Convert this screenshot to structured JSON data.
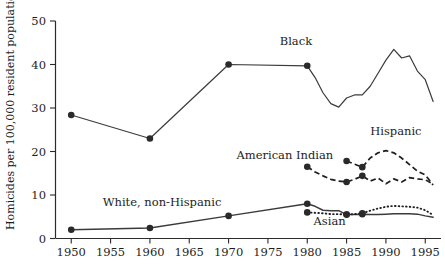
{
  "chart_data": {
    "type": "line",
    "title": "",
    "xlabel": "",
    "ylabel": "Homicides per 100,000 resident population",
    "xlim": [
      1948,
      1997
    ],
    "ylim": [
      0,
      50
    ],
    "xticks": [
      1950,
      1955,
      1960,
      1965,
      1970,
      1975,
      1980,
      1985,
      1990,
      1995
    ],
    "yticks": [
      0,
      10,
      20,
      30,
      40,
      50
    ],
    "grid": false,
    "legend": "inline-annotations",
    "series": [
      {
        "name": "Black",
        "label": "Black",
        "style": "solid",
        "markers": [
          1950,
          1960,
          1970,
          1980
        ],
        "x": [
          1950,
          1960,
          1970,
          1980,
          1981,
          1982,
          1983,
          1984,
          1985,
          1986,
          1987,
          1988,
          1989,
          1990,
          1991,
          1992,
          1993,
          1994,
          1995,
          1996
        ],
        "y": [
          28.4,
          23.0,
          40.0,
          39.7,
          37.0,
          33.5,
          31.0,
          30.2,
          32.3,
          33.0,
          33.0,
          35.0,
          38.0,
          41.0,
          43.5,
          41.5,
          42.0,
          38.5,
          36.5,
          31.5
        ]
      },
      {
        "name": "Hispanic",
        "label": "Hispanic",
        "style": "dashed",
        "markers": [
          1985,
          1987
        ],
        "x": [
          1985,
          1987,
          1988,
          1989,
          1990,
          1991,
          1992,
          1993,
          1994,
          1995,
          1996
        ],
        "y": [
          17.8,
          16.4,
          18.5,
          19.7,
          20.2,
          19.7,
          18.5,
          17.0,
          15.5,
          14.6,
          12.3
        ]
      },
      {
        "name": "American Indian",
        "label": "American Indian",
        "style": "dashed",
        "markers": [
          1980,
          1985,
          1987
        ],
        "x": [
          1980,
          1981,
          1982,
          1983,
          1984,
          1985,
          1986,
          1987,
          1988,
          1989,
          1990,
          1991,
          1992,
          1993,
          1994,
          1995,
          1996
        ],
        "y": [
          16.5,
          15.3,
          14.4,
          13.6,
          13.2,
          13.0,
          13.6,
          14.4,
          13.2,
          13.9,
          12.6,
          13.7,
          13.0,
          14.0,
          13.7,
          13.5,
          12.5
        ]
      },
      {
        "name": "White, non-Hispanic",
        "label": "White, non-Hispanic",
        "style": "solid",
        "markers": [
          1950,
          1960,
          1970,
          1980,
          1985,
          1987
        ],
        "x": [
          1950,
          1960,
          1970,
          1980,
          1981,
          1982,
          1983,
          1984,
          1985,
          1986,
          1987,
          1988,
          1989,
          1990,
          1991,
          1992,
          1993,
          1994,
          1995,
          1996
        ],
        "y": [
          2.0,
          2.4,
          5.2,
          8.0,
          7.4,
          6.5,
          6.4,
          6.4,
          5.5,
          5.5,
          5.6,
          5.5,
          5.5,
          5.6,
          5.7,
          5.7,
          5.7,
          5.6,
          5.2,
          4.9
        ]
      },
      {
        "name": "Asian",
        "label": "Asian",
        "style": "dotted",
        "markers": [
          1980,
          1985,
          1987
        ],
        "x": [
          1980,
          1981,
          1982,
          1983,
          1984,
          1985,
          1986,
          1987,
          1988,
          1989,
          1990,
          1991,
          1992,
          1993,
          1994,
          1995,
          1996
        ],
        "y": [
          6.0,
          5.9,
          5.8,
          5.6,
          5.6,
          5.5,
          5.6,
          5.8,
          6.4,
          6.9,
          7.3,
          7.5,
          7.4,
          7.3,
          7.1,
          6.5,
          5.4
        ]
      }
    ],
    "annotations": [
      {
        "text": "Black",
        "x": 1976.5,
        "y": 44.5
      },
      {
        "text": "Hispanic",
        "x": 1988.0,
        "y": 23.8
      },
      {
        "text": "American Indian",
        "x": 1971.0,
        "y": 18.2
      },
      {
        "text": "White, non-Hispanic",
        "x": 1954.0,
        "y": 7.4
      },
      {
        "text": "Asian",
        "x": 1980.8,
        "y": 3.0
      }
    ]
  }
}
